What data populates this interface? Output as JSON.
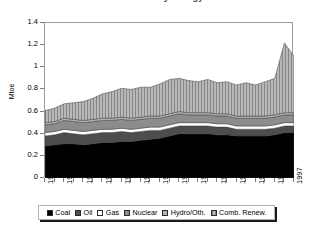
{
  "chart_data": {
    "type": "area",
    "title": "Total Primary Energy",
    "subtitle": "",
    "xlabel": "",
    "ylabel": "Mtoe",
    "ylim": [
      0,
      1.4
    ],
    "ytick_values": [
      0,
      0.2,
      0.4,
      0.6,
      0.8,
      1,
      1.2,
      1.4
    ],
    "ytick_labels": [
      "0",
      "0.2",
      "0.4",
      "0.6",
      "0.8",
      "1",
      "1.2",
      "1.4"
    ],
    "xlim": [
      1971,
      1997
    ],
    "x": [
      1971,
      1972,
      1973,
      1974,
      1975,
      1976,
      1977,
      1978,
      1979,
      1980,
      1981,
      1982,
      1983,
      1984,
      1985,
      1986,
      1987,
      1988,
      1989,
      1990,
      1991,
      1992,
      1993,
      1994,
      1995,
      1996,
      1997
    ],
    "xtick_labels": [
      "1971",
      "1973",
      "1975",
      "1977",
      "1979",
      "1981",
      "1983",
      "1985",
      "1987",
      "1989",
      "1991",
      "1993",
      "1995",
      "1997"
    ],
    "grid": false,
    "legend_position": "bottom",
    "stacked": true,
    "series": [
      {
        "name": "Coal",
        "color": "#000000",
        "pattern": "solid",
        "values": [
          0.29,
          0.3,
          0.31,
          0.31,
          0.3,
          0.31,
          0.32,
          0.32,
          0.33,
          0.33,
          0.34,
          0.35,
          0.36,
          0.38,
          0.4,
          0.4,
          0.4,
          0.4,
          0.39,
          0.39,
          0.38,
          0.38,
          0.38,
          0.38,
          0.39,
          0.41,
          0.41
        ]
      },
      {
        "name": "Oil",
        "color": "#4d4d4d",
        "pattern": "solid",
        "values": [
          0.09,
          0.09,
          0.1,
          0.09,
          0.09,
          0.09,
          0.09,
          0.09,
          0.09,
          0.08,
          0.08,
          0.08,
          0.07,
          0.07,
          0.07,
          0.07,
          0.07,
          0.07,
          0.07,
          0.07,
          0.06,
          0.06,
          0.06,
          0.06,
          0.06,
          0.06,
          0.06
        ]
      },
      {
        "name": "Gas",
        "color": "#ffffff",
        "pattern": "solid",
        "values": [
          0.03,
          0.03,
          0.03,
          0.03,
          0.03,
          0.03,
          0.03,
          0.03,
          0.03,
          0.03,
          0.03,
          0.03,
          0.03,
          0.03,
          0.03,
          0.03,
          0.03,
          0.03,
          0.03,
          0.03,
          0.03,
          0.03,
          0.03,
          0.03,
          0.03,
          0.03,
          0.03
        ]
      },
      {
        "name": "Nuclear",
        "color": "#8c8c8c",
        "pattern": "solid",
        "values": [
          0.07,
          0.07,
          0.08,
          0.08,
          0.08,
          0.08,
          0.08,
          0.08,
          0.08,
          0.08,
          0.08,
          0.08,
          0.08,
          0.08,
          0.08,
          0.07,
          0.07,
          0.07,
          0.07,
          0.07,
          0.07,
          0.07,
          0.07,
          0.07,
          0.07,
          0.07,
          0.07
        ]
      },
      {
        "name": "Hydro/Oth.",
        "color": "#b3b3b3",
        "pattern": "solid",
        "values": [
          0.02,
          0.02,
          0.02,
          0.02,
          0.02,
          0.02,
          0.02,
          0.02,
          0.02,
          0.02,
          0.02,
          0.02,
          0.02,
          0.02,
          0.02,
          0.02,
          0.02,
          0.02,
          0.02,
          0.02,
          0.02,
          0.02,
          0.02,
          0.02,
          0.02,
          0.02,
          0.02
        ]
      },
      {
        "name": "Comb. Renew.",
        "color": "#a6a6a6",
        "pattern": "vertical-hatch",
        "values": [
          0.11,
          0.12,
          0.13,
          0.15,
          0.17,
          0.19,
          0.22,
          0.24,
          0.26,
          0.26,
          0.27,
          0.26,
          0.29,
          0.31,
          0.3,
          0.29,
          0.28,
          0.3,
          0.28,
          0.29,
          0.28,
          0.3,
          0.28,
          0.31,
          0.33,
          0.63,
          0.51
        ]
      }
    ],
    "totals": [
      0.61,
      0.63,
      0.67,
      0.68,
      0.69,
      0.72,
      0.76,
      0.78,
      0.81,
      0.8,
      0.82,
      0.82,
      0.85,
      0.89,
      0.9,
      0.88,
      0.87,
      0.89,
      0.86,
      0.87,
      0.84,
      0.86,
      0.84,
      0.87,
      0.9,
      1.22,
      1.1
    ]
  }
}
